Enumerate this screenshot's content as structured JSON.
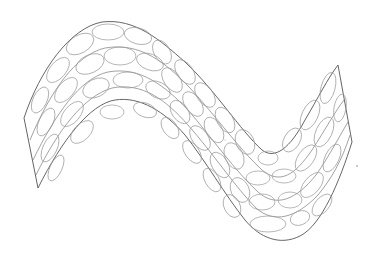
{
  "drawing": {
    "subject": "wavy sine-shaped sheet covered with overlapping ellipses",
    "style": "thin gray line art on white",
    "colors": {
      "background": "#ffffff",
      "outline": "#555555",
      "ribs": "#7a7a7a",
      "cells": "#9a9a9a"
    },
    "outline_points": {
      "left_tip": [
        38,
        188
      ],
      "left_corner": [
        24,
        118
      ],
      "top_crest": [
        100,
        22
      ],
      "inner_crest": [
        110,
        100
      ],
      "bottom_trough": [
        270,
        240
      ],
      "inner_trough": [
        285,
        158
      ],
      "right_apex": [
        338,
        65
      ],
      "right_corner": [
        352,
        142
      ]
    }
  }
}
